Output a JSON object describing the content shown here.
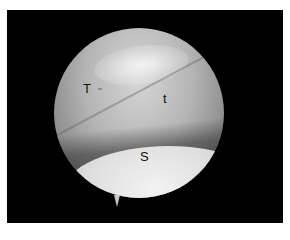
{
  "image": {
    "description": "Arthroscopic view within a circular scope field on black background",
    "labels": [
      {
        "id": "T",
        "text": "T"
      },
      {
        "id": "t",
        "text": "t"
      },
      {
        "id": "S",
        "text": "S"
      }
    ],
    "colors": {
      "background": "#000000",
      "page": "#ffffff",
      "label": "#111111"
    }
  }
}
